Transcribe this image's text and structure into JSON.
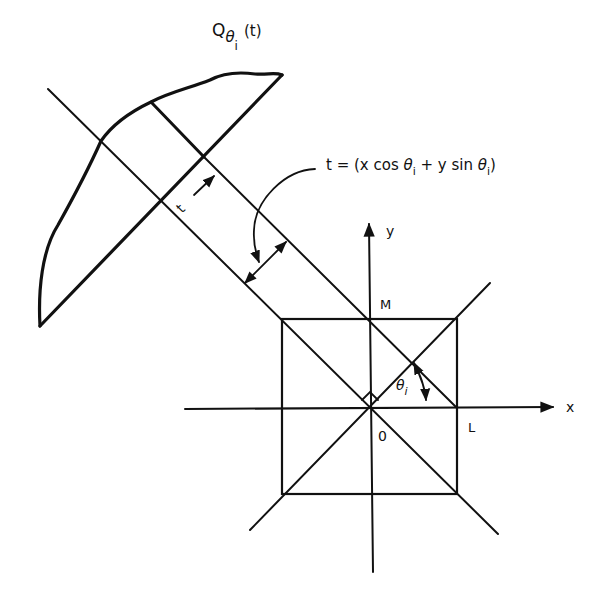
{
  "diagram": {
    "colors": {
      "ink": "#111111",
      "background": "#ffffff"
    },
    "labels": {
      "projection_main": "Q",
      "projection_sub_theta": "θ",
      "projection_sub_i": "i",
      "projection_arg": "(t)",
      "equation_prefix": "t = (x cos ",
      "equation_theta1": "θ",
      "equation_sub1": "i",
      "equation_mid": " + y sin ",
      "equation_theta2": "θ",
      "equation_sub2": "i",
      "equation_suffix": ")",
      "t_label": "t",
      "y_axis": "y",
      "x_axis": "x",
      "point_m": "M",
      "point_l": "L",
      "origin": "0",
      "angle_theta": "θ",
      "angle_sub": "i"
    },
    "axes": {
      "origin": [
        370,
        408
      ],
      "x_axis": {
        "from": [
          185,
          409
        ],
        "to": [
          555,
          407
        ]
      },
      "y_axis": {
        "from": [
          373,
          572
        ],
        "to": [
          369,
          222
        ]
      }
    },
    "square": {
      "left": 282,
      "top": 319,
      "right": 457,
      "bottom": 494
    }
  }
}
